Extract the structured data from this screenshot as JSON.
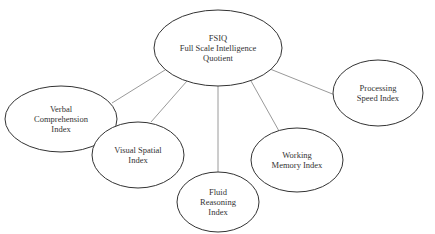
{
  "diagram": {
    "type": "hierarchy",
    "stroke_color": "#333333",
    "line_color": "#9a9a9a",
    "root": {
      "id": "fsiq",
      "lines": [
        "FSIQ",
        "Full Scale Intelligence",
        "Quotient"
      ],
      "cx": 218,
      "cy": 48,
      "rx": 64,
      "ry": 38
    },
    "children": [
      {
        "id": "verbal-comprehension-index",
        "lines": [
          "Verbal",
          "Comprehension",
          "Index"
        ],
        "cx": 61,
        "cy": 119,
        "rx": 56,
        "ry": 33
      },
      {
        "id": "visual-spatial-index",
        "lines": [
          "Visual Spatial",
          "Index"
        ],
        "cx": 138,
        "cy": 155,
        "rx": 46,
        "ry": 33
      },
      {
        "id": "fluid-reasoning-index",
        "lines": [
          "Fluid",
          "Reasoning",
          "Index"
        ],
        "cx": 218,
        "cy": 202,
        "rx": 41,
        "ry": 30
      },
      {
        "id": "working-memory-index",
        "lines": [
          "Working",
          "Memory Index"
        ],
        "cx": 297,
        "cy": 160,
        "rx": 46,
        "ry": 32
      },
      {
        "id": "processing-speed-index",
        "lines": [
          "Processing",
          "Speed Index"
        ],
        "cx": 378,
        "cy": 93,
        "rx": 45,
        "ry": 33
      }
    ],
    "edges": [
      {
        "from": [
          165,
          70
        ],
        "to": [
          112,
          103
        ]
      },
      {
        "from": [
          187,
          81
        ],
        "to": [
          151,
          122
        ]
      },
      {
        "from": [
          218,
          86
        ],
        "to": [
          218,
          172
        ]
      },
      {
        "from": [
          251,
          81
        ],
        "to": [
          279,
          131
        ]
      },
      {
        "from": [
          270,
          69
        ],
        "to": [
          335,
          95
        ]
      }
    ]
  }
}
